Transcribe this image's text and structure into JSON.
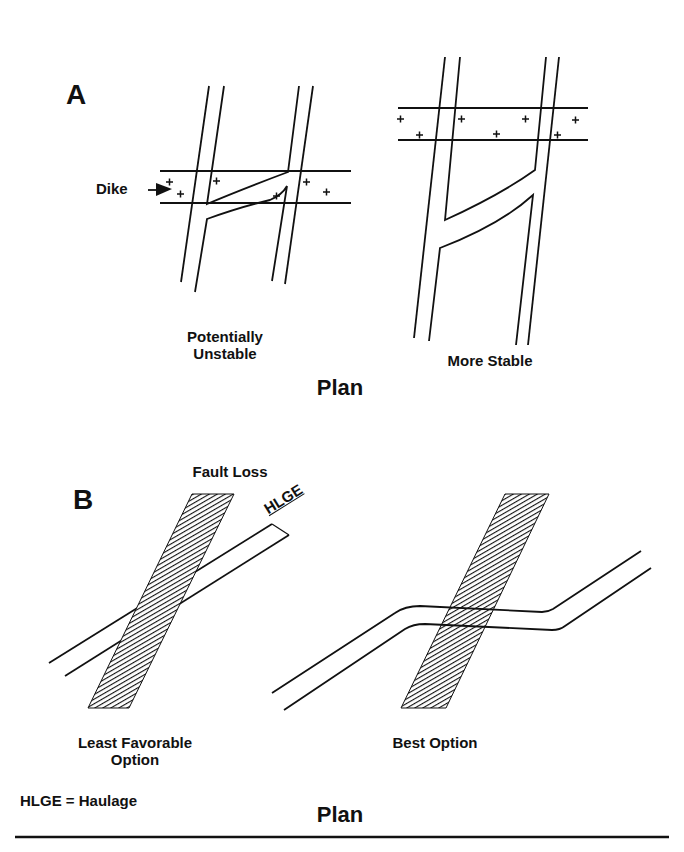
{
  "panel_a": {
    "letter": "A",
    "dike_label": "Dike",
    "left_caption_line1": "Potentially",
    "left_caption_line2": "Unstable",
    "right_caption": "More Stable",
    "plan_label": "Plan"
  },
  "panel_b": {
    "letter": "B",
    "fault_label": "Fault Loss",
    "haulage_label": "HLGE",
    "left_caption_line1": "Least Favorable",
    "left_caption_line2": "Option",
    "right_caption": "Best Option",
    "legend": "HLGE = Haulage",
    "plan_label": "Plan"
  },
  "colors": {
    "line": "#111111",
    "background": "#ffffff"
  }
}
